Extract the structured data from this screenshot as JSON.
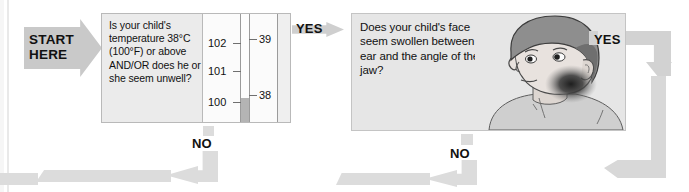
{
  "flow": {
    "start": {
      "label": "START\nHERE",
      "name": "start-here-arrow"
    },
    "nodes": [
      {
        "id": "fever-question",
        "question": "Is your child's temperature 38°C (100°F) or above AND/OR does he or she seem unwell?",
        "has_thermometer": true
      },
      {
        "id": "swelling-question",
        "question": "Does your child's face seem swollen between the ear and the angle of the jaw?",
        "has_illustration": true
      }
    ],
    "connectors": {
      "yes_1": "YES",
      "yes_2": "YES",
      "no_1": "NO",
      "no_2": "NO"
    }
  },
  "thermometer": {
    "fahrenheit_labels": [
      "102",
      "101",
      "100"
    ],
    "celsius_labels": [
      "39",
      "38"
    ],
    "mercury_level_f": "100",
    "mercury_level_c": "38"
  },
  "illustration": {
    "alt": "child-head-with-jaw-swelling",
    "skin": "#e8e2de",
    "hair": "#8e8e8e",
    "shirt": "#cfcfcf",
    "swelling": "#3a3a3a"
  },
  "colors": {
    "panel_fill": "#ebebeb",
    "panel_border": "#b9b9b9",
    "arrow_grey": "#c9c9c9",
    "connector_grey": "#dcdcdc",
    "text": "#111111"
  }
}
